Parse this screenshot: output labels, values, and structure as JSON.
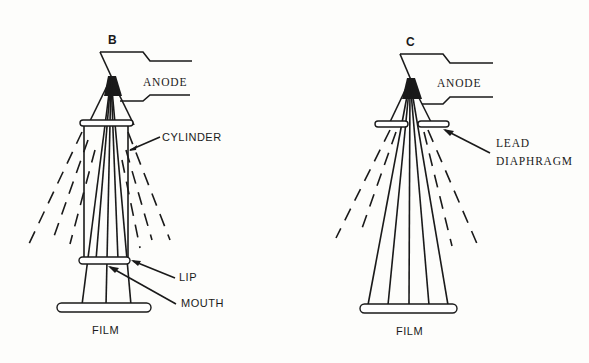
{
  "diagrams": [
    {
      "id": "B",
      "title": "B",
      "labels": {
        "anode": "ANODE",
        "cylinder": "CYLINDER",
        "lip": "LIP",
        "mouth": "MOUTH",
        "film": "FILM"
      }
    },
    {
      "id": "C",
      "title": "C",
      "labels": {
        "anode": "ANODE",
        "lead_line1": "LEAD",
        "lead_line2": "DIAPHRAGM",
        "film": "FILM"
      }
    }
  ],
  "colors": {
    "ink": "#1a1a1a",
    "paper": "#fdfdfb"
  }
}
